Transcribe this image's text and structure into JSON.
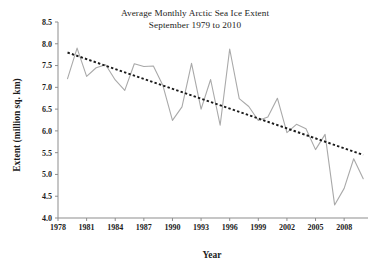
{
  "chart_data": {
    "type": "line",
    "title": "Average Monthly Arctic Sea Ice Extent",
    "subtitle": "September 1979 to 2010",
    "xlabel": "Year",
    "ylabel": "Extent (million sq. km)",
    "xlim": [
      1978,
      2010.5
    ],
    "ylim": [
      4.0,
      8.5
    ],
    "grid": false,
    "legend": "none",
    "x_ticks": [
      1978,
      1981,
      1984,
      1987,
      1990,
      1993,
      1996,
      1999,
      2002,
      2005,
      2008
    ],
    "y_ticks": [
      "4.0",
      "4.5",
      "5.0",
      "5.5",
      "6.0",
      "6.5",
      "7.0",
      "7.5",
      "8.0",
      "8.5"
    ],
    "x": [
      1979,
      1980,
      1981,
      1982,
      1983,
      1984,
      1985,
      1986,
      1987,
      1988,
      1989,
      1990,
      1991,
      1992,
      1993,
      1994,
      1995,
      1996,
      1997,
      1998,
      1999,
      2000,
      2001,
      2002,
      2003,
      2004,
      2005,
      2006,
      2007,
      2008,
      2009,
      2010
    ],
    "series": [
      {
        "name": "September sea ice extent",
        "color": "#a9a9a9",
        "style": "solid",
        "values": [
          7.2,
          7.9,
          7.25,
          7.45,
          7.52,
          7.17,
          6.93,
          7.54,
          7.48,
          7.49,
          7.04,
          6.24,
          6.55,
          7.55,
          6.5,
          7.18,
          6.13,
          7.88,
          6.74,
          6.56,
          6.24,
          6.32,
          6.75,
          5.96,
          6.15,
          6.05,
          5.57,
          5.92,
          4.3,
          4.68,
          5.36,
          4.9
        ]
      },
      {
        "name": "Linear trend",
        "color": "#1a1a1a",
        "style": "dotted",
        "endpoints": [
          {
            "x": 1979,
            "y": 7.8
          },
          {
            "x": 2010,
            "y": 5.45
          }
        ]
      }
    ]
  }
}
